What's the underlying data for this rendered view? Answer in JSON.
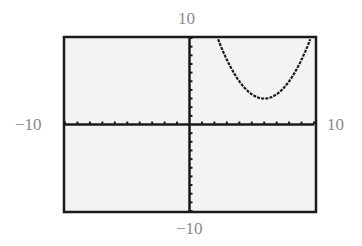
{
  "window": {
    "xmin_label": "−10",
    "xmax_label": "10",
    "ymin_label": "−10",
    "ymax_label": "10"
  },
  "colors": {
    "frame": "#1a1a1a",
    "screen_bg": "#f3f3f3",
    "axis": "#1a1a1a",
    "curve": "#1a1a1a",
    "label": "#8a8a8a"
  },
  "chart_data": {
    "type": "line",
    "title": "",
    "xlabel": "",
    "ylabel": "",
    "xlim": [
      -10,
      10
    ],
    "ylim": [
      -10,
      10
    ],
    "xscl": 1,
    "yscl": 1,
    "grid": false,
    "legend": null,
    "annotations": [
      "-10",
      "10",
      "-10",
      "10"
    ],
    "series": [
      {
        "name": "parabola",
        "equation_estimate": "y = 0.5(x - 6)^2 + 3",
        "vertex": [
          6,
          3
        ],
        "x": [
          2.2,
          3,
          4,
          5,
          6,
          7,
          8,
          9,
          9.7
        ],
        "y": [
          10,
          7.5,
          5,
          3.5,
          3,
          3.5,
          5,
          7.5,
          10
        ]
      }
    ]
  }
}
